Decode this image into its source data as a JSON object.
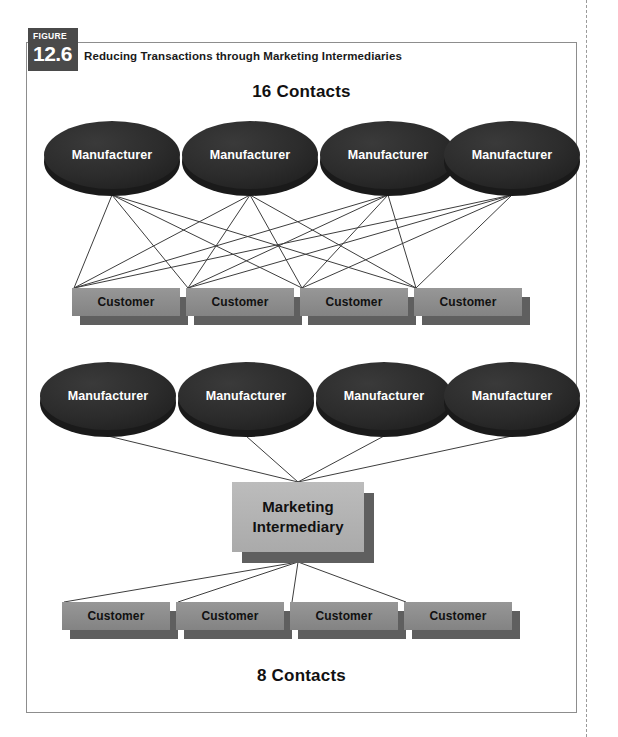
{
  "figure": {
    "badge_word": "FIGURE",
    "badge_number": "12.6",
    "caption": "Reducing Transactions through Marketing Intermediaries"
  },
  "headings": {
    "top": "16 Contacts",
    "bottom": "8 Contacts"
  },
  "labels": {
    "manufacturer": "Manufacturer",
    "customer": "Customer",
    "intermediary_line1": "Marketing",
    "intermediary_line2": "Intermediary"
  },
  "colors": {
    "badge_bg": "#4a4a4a",
    "frame_border": "#8d8d8d",
    "manufacturer_fill": "#2b2b2b",
    "manufacturer_edge": "#1a1a1a",
    "manufacturer_text": "#ffffff",
    "customer_fill": "#8d8d8d",
    "customer_shadow": "#5f5f5f",
    "intermediary_fill": "#b4b4b4",
    "intermediary_shadow": "#5f5f5f",
    "link_line": "#3d3d3d",
    "heading_text": "#111111",
    "gutter_dash": "#9a9a9a"
  },
  "chart_data": {
    "type": "diagram",
    "title": "Reducing Transactions through Marketing Intermediaries",
    "panels": [
      {
        "name": "without-intermediary",
        "heading": "16 Contacts",
        "contacts": 16,
        "producers": 4,
        "consumers": 4,
        "structure": "complete-bipartite",
        "producer_label": "Manufacturer",
        "consumer_label": "Customer"
      },
      {
        "name": "with-intermediary",
        "heading": "8 Contacts",
        "contacts": 8,
        "producers": 4,
        "consumers": 4,
        "hubs": 1,
        "structure": "hub-and-spoke",
        "producer_label": "Manufacturer",
        "consumer_label": "Customer",
        "hub_label": "Marketing Intermediary"
      }
    ]
  },
  "geometry": {
    "manufacturers_top": [
      {
        "cx": 112,
        "cy": 155
      },
      {
        "cx": 250,
        "cy": 155
      },
      {
        "cx": 388,
        "cy": 155
      },
      {
        "cx": 512,
        "cy": 155
      }
    ],
    "customers_top": [
      {
        "x": 72,
        "y": 288
      },
      {
        "x": 186,
        "y": 288
      },
      {
        "x": 300,
        "y": 288
      },
      {
        "x": 414,
        "y": 288
      }
    ],
    "manufacturers_bottom": [
      {
        "cx": 108,
        "cy": 396
      },
      {
        "cx": 246,
        "cy": 396
      },
      {
        "cx": 384,
        "cy": 396
      },
      {
        "cx": 512,
        "cy": 396
      }
    ],
    "intermediary": {
      "x": 232,
      "y": 482,
      "w": 132,
      "h": 70
    },
    "customers_bottom": [
      {
        "x": 62,
        "y": 602
      },
      {
        "x": 176,
        "y": 602
      },
      {
        "x": 290,
        "y": 602
      },
      {
        "x": 404,
        "y": 602
      }
    ],
    "box_w": 108,
    "box_h": 28,
    "ellipse_rx": 68,
    "ellipse_ry": 34
  }
}
